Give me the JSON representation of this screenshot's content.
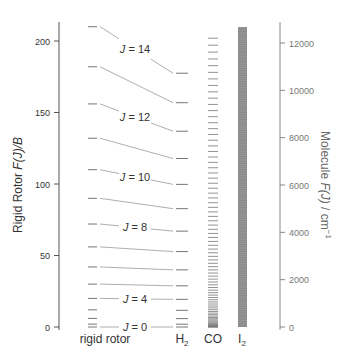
{
  "left_axis": {
    "label_plain": "Rigid Rotor ",
    "label_italic": "F(J)/B",
    "ticks": [
      0,
      50,
      100,
      150,
      200
    ],
    "range": [
      0,
      210
    ]
  },
  "right_axis": {
    "label_plain": "Molecule ",
    "label_italic": "F(J)",
    "label_unit": " / cm",
    "label_sup": "−1",
    "ticks": [
      0,
      2000,
      4000,
      6000,
      8000,
      10000,
      12000
    ],
    "range": [
      0,
      12500
    ]
  },
  "columns": {
    "rigid_rotor": "rigid rotor",
    "h2": "H",
    "h2_sub": "2",
    "co": "CO",
    "i2": "I",
    "i2_sub": "2"
  },
  "level_labels": [
    "J = 0",
    "J = 4",
    "J = 8",
    "J = 10",
    "J = 12",
    "J = 14"
  ],
  "chart_data": {
    "type": "diagram",
    "title": "",
    "rigid_rotor_levels_F_over_B": [
      0,
      2,
      6,
      12,
      20,
      30,
      42,
      56,
      72,
      90,
      110,
      132,
      156,
      182,
      210
    ],
    "h2_levels_cm-1": [
      0,
      118,
      354,
      705,
      1168,
      1740,
      2414,
      3187,
      4051,
      5000,
      6026,
      7120,
      8273,
      9477,
      10723
    ],
    "co_B_cm-1": 1.92,
    "co_max_J": 80,
    "i2_B_cm-1": 0.037,
    "labeled_J": [
      0,
      4,
      8,
      10,
      12,
      14
    ],
    "left_ylabel": "Rigid Rotor F(J)/B",
    "right_ylabel": "Molecule F(J) / cm^-1",
    "xlabels": [
      "rigid rotor",
      "H2",
      "CO",
      "I2"
    ]
  },
  "colors": {
    "axis": "#555555",
    "level": "#777777",
    "connector": "#999999",
    "text": "#333333",
    "i2_band": "#8a8a8a"
  }
}
